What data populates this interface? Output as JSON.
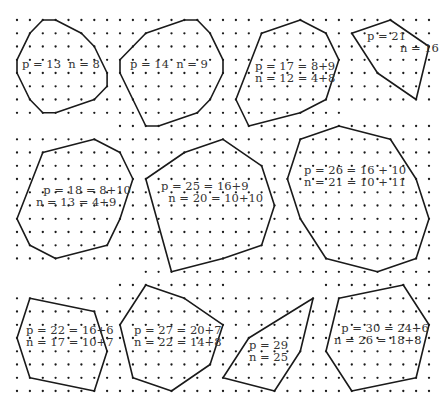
{
  "figure": {
    "grid": {
      "x0": 17,
      "dx": 12.875,
      "cols": 33,
      "y0": 20,
      "dy": 13.25,
      "rows": 29,
      "row_ranges": {
        "7": [
          [
            0,
            25
          ]
        ],
        "8": [
          [
            8,
            32
          ]
        ],
        "19": [
          [
            10,
            32
          ]
        ],
        "20": [
          [
            8,
            16
          ],
          [
            24,
            32
          ]
        ]
      }
    },
    "colors": {
      "ink": "#1a1a1a",
      "label": "#333333",
      "background": "#ffffff"
    },
    "polygons": [
      {
        "id": "poly-1",
        "vertices": [
          [
            2,
            0
          ],
          [
            3,
            0
          ],
          [
            5,
            1
          ],
          [
            6,
            2
          ],
          [
            7,
            4
          ],
          [
            7,
            5
          ],
          [
            6,
            6
          ],
          [
            3,
            7
          ],
          [
            2,
            7
          ],
          [
            1,
            6
          ],
          [
            0,
            4
          ],
          [
            0,
            3
          ],
          [
            1,
            1
          ]
        ],
        "label": [
          "p = 13  n = 8"
        ],
        "label_pos": [
          22,
          58
        ]
      },
      {
        "id": "poly-2",
        "vertices": [
          [
            10,
            1
          ],
          [
            13,
            0
          ],
          [
            14,
            0
          ],
          [
            15,
            1
          ],
          [
            16,
            3
          ],
          [
            16,
            4
          ],
          [
            15,
            6
          ],
          [
            14,
            7
          ],
          [
            11,
            8
          ],
          [
            10,
            8
          ],
          [
            9,
            6
          ],
          [
            8,
            4
          ],
          [
            8,
            3
          ]
        ],
        "label": [
          "p = 14  n = 9"
        ],
        "label_pos": [
          130,
          58
        ]
      },
      {
        "id": "poly-3",
        "vertices": [
          [
            19,
            1
          ],
          [
            22,
            0
          ],
          [
            24,
            1
          ],
          [
            25,
            3
          ],
          [
            24,
            6
          ],
          [
            22,
            7
          ],
          [
            18,
            8
          ],
          [
            17,
            6
          ]
        ],
        "label": [
          "p = 17 = 8+9",
          "n = 12 = 4+8"
        ],
        "label_pos": [
          255,
          60
        ]
      },
      {
        "id": "poly-4",
        "vertices": [
          [
            26,
            1
          ],
          [
            29,
            0
          ],
          [
            32,
            2
          ],
          [
            31,
            6
          ],
          [
            28,
            4
          ]
        ],
        "label": [
          "p = 21",
          "         n = 16"
        ],
        "label_pos": [
          367,
          30
        ]
      },
      {
        "id": "poly-5",
        "vertices": [
          [
            2,
            10
          ],
          [
            6,
            9
          ],
          [
            8,
            10
          ],
          [
            9,
            12
          ],
          [
            8,
            15
          ],
          [
            7,
            17
          ],
          [
            3,
            18
          ],
          [
            1,
            17
          ],
          [
            0,
            15
          ]
        ],
        "label": [
          "  p = 18 = 8+10",
          "n = 13 = 4+9"
        ],
        "label_pos": [
          36,
          184
        ]
      },
      {
        "id": "poly-6",
        "vertices": [
          [
            10,
            12
          ],
          [
            13,
            10
          ],
          [
            16,
            9
          ],
          [
            19,
            11
          ],
          [
            20,
            14
          ],
          [
            19,
            17
          ],
          [
            16,
            18
          ],
          [
            12,
            19
          ]
        ],
        "label": [
          "p = 25 = 16+9",
          "  n = 20 = 10+10"
        ],
        "label_pos": [
          161,
          180
        ]
      },
      {
        "id": "poly-7",
        "vertices": [
          [
            22,
            9
          ],
          [
            25,
            8
          ],
          [
            29,
            9
          ],
          [
            31,
            12
          ],
          [
            32,
            15
          ],
          [
            31,
            18
          ],
          [
            28,
            19
          ],
          [
            24,
            18
          ],
          [
            22,
            15
          ],
          [
            21,
            12
          ]
        ],
        "label": [
          "p = 26 = 16 + 10",
          "n = 21 = 10 + 11"
        ],
        "label_pos": [
          304,
          164
        ]
      },
      {
        "id": "poly-8",
        "vertices": [
          [
            1,
            21
          ],
          [
            6,
            22
          ],
          [
            7,
            25
          ],
          [
            6,
            28
          ],
          [
            1,
            27
          ],
          [
            0,
            24
          ]
        ],
        "label": [
          "p = 22 = 16+6",
          "n = 17 = 10+7"
        ],
        "label_pos": [
          26,
          324
        ]
      },
      {
        "id": "poly-9",
        "vertices": [
          [
            10,
            20
          ],
          [
            13,
            21
          ],
          [
            16,
            23
          ],
          [
            15,
            26
          ],
          [
            12,
            28
          ],
          [
            9,
            27
          ],
          [
            8,
            23
          ]
        ],
        "label": [
          "p = 27 = 20+7",
          "n = 22 = 14+8"
        ],
        "label_pos": [
          134,
          324
        ]
      },
      {
        "id": "poly-10",
        "vertices": [
          [
            23,
            21
          ],
          [
            18,
            24
          ],
          [
            16,
            27
          ],
          [
            20,
            28
          ],
          [
            22,
            25
          ]
        ],
        "label": [
          "p = 29",
          "n = 25"
        ],
        "label_pos": [
          249,
          339
        ]
      },
      {
        "id": "poly-11",
        "vertices": [
          [
            25,
            21
          ],
          [
            30,
            20
          ],
          [
            32,
            23
          ],
          [
            31,
            27
          ],
          [
            26,
            28
          ],
          [
            24,
            25
          ]
        ],
        "label": [
          "  p = 30 = 24+6",
          "n = 26 = 18+8"
        ],
        "label_pos": [
          334,
          322
        ]
      }
    ]
  }
}
